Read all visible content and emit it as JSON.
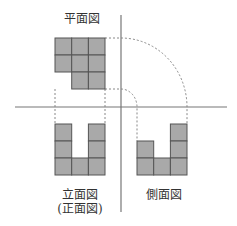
{
  "labels": {
    "plan": "平面図",
    "front_line1": "立面図",
    "front_line2": "(正面図)",
    "side": "側面図"
  },
  "colors": {
    "cell_fill": "#a9a9a9",
    "cell_stroke": "#555555",
    "axis": "#777777",
    "dashed": "#888888"
  },
  "views": {
    "plan": {
      "rows": [
        [
          1,
          1,
          1
        ],
        [
          1,
          1,
          1
        ],
        [
          0,
          1,
          1
        ]
      ]
    },
    "front": {
      "rows": [
        [
          1,
          0,
          1
        ],
        [
          1,
          0,
          1
        ],
        [
          1,
          1,
          1
        ]
      ]
    },
    "side": {
      "rows": [
        [
          0,
          0,
          1
        ],
        [
          1,
          0,
          1
        ],
        [
          1,
          1,
          1
        ]
      ]
    }
  }
}
